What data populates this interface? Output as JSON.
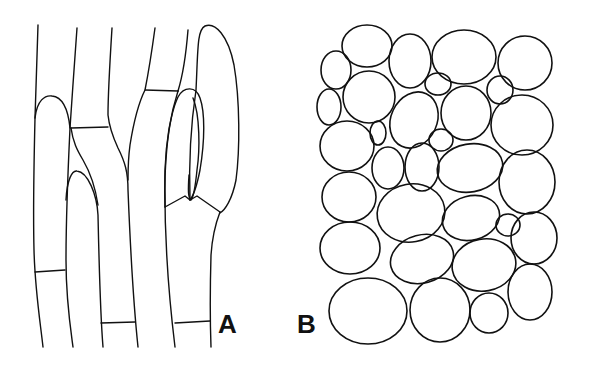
{
  "figure": {
    "panels": [
      {
        "id": "A",
        "label": "A",
        "description": "elongated cylindrical cells with transverse septa and rounded tips"
      },
      {
        "id": "B",
        "label": "B",
        "description": "rounded polygonal cells packed in a tissue"
      }
    ],
    "colors": {
      "line": "#111111",
      "background": "#ffffff"
    }
  }
}
